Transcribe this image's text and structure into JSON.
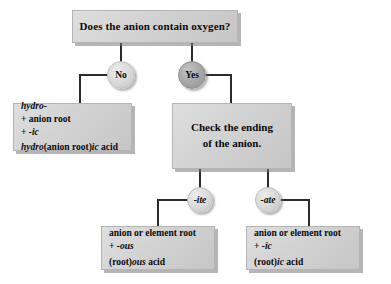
{
  "diagram": {
    "title": "Does the anion contain oxygen?",
    "colors": {
      "box_fill": "#d2d2d2",
      "box_border": "#b4b4b4",
      "circle_light": "#dcdcdc",
      "circle_dark": "#a9a9a9",
      "line": "#2b2b2b",
      "text": "#0a0a0a",
      "background": "#ffffff"
    },
    "root": {
      "label": "Does the anion contain oxygen?"
    },
    "decisions": {
      "no": "No",
      "yes": "Yes",
      "ite": "-ite",
      "ate": "-ate"
    },
    "hydro_box": {
      "line1_italic": "hydro-",
      "line2": "+ anion root",
      "line3_prefix": "+ ",
      "line3_italic": "-ic",
      "result_prefix_italic": "hydro",
      "result_middle": "(anion root)",
      "result_italic": "ic",
      "result_suffix": " acid"
    },
    "check_box": {
      "line1": "Check the ending",
      "line2": "of the anion."
    },
    "ous_box": {
      "line1": "anion or element root",
      "line2_prefix": "+ ",
      "line2_italic": "-ous",
      "result_prefix": "(root)",
      "result_italic": "ous",
      "result_suffix": " acid"
    },
    "ic_box": {
      "line1": "anion or element root",
      "line2_prefix": "+ ",
      "line2_italic": "-ic",
      "result_prefix": "(root)",
      "result_italic": "ic",
      "result_suffix": " acid"
    }
  }
}
